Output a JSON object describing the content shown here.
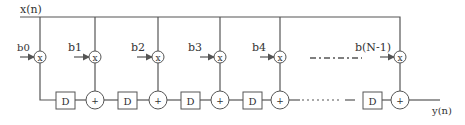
{
  "diagram": {
    "type": "FIR filter (transposed direct form)",
    "input_label": "x(n)",
    "output_label": "y(n)",
    "multiplier_symbol": "x",
    "adder_symbol": "+",
    "delay_label": "D",
    "coefficients": [
      "b0",
      "b1",
      "b2",
      "b3",
      "b4",
      "b(N-1)"
    ],
    "colors": {
      "line": "#555555",
      "text": "#333333",
      "background": "#ffffff"
    }
  }
}
